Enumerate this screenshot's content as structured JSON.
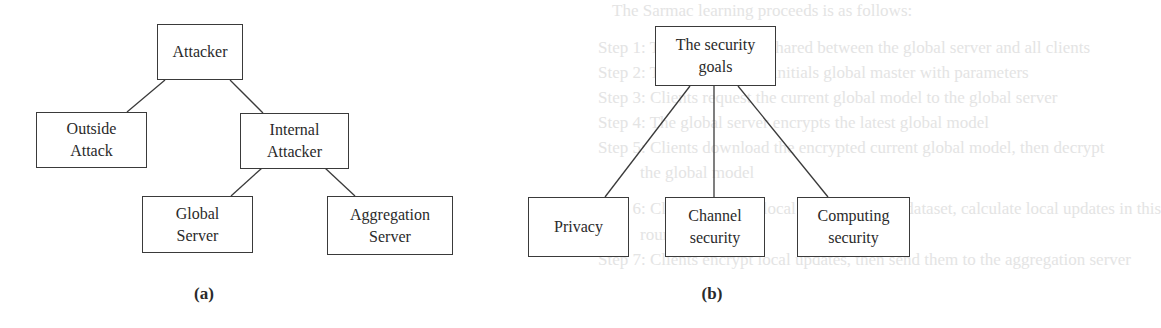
{
  "background_text": [
    {
      "text": "The Sarmac learning proceeds is as follows:",
      "x": 612,
      "y": 10
    },
    {
      "text": "Step 1: The secret key is shared between the global server and all clients",
      "x": 598,
      "y": 47
    },
    {
      "text": "Step 2: The global server initials global master with parameters",
      "x": 598,
      "y": 72
    },
    {
      "text": "Step 3: Clients request the current global model to the global server",
      "x": 598,
      "y": 97
    },
    {
      "text": "Step 4: The global server encrypts the latest global model",
      "x": 598,
      "y": 122
    },
    {
      "text": "Step 5: Clients download the encrypted current global model, then decrypt",
      "x": 598,
      "y": 147
    },
    {
      "text": "the global model",
      "x": 640,
      "y": 172
    },
    {
      "text": "Step 6: Clients train the local model on local dataset, calculate local updates in this",
      "x": 598,
      "y": 208
    },
    {
      "text": "round",
      "x": 640,
      "y": 234
    },
    {
      "text": "Step 7: Clients encrypt local updates, then send them to the aggregation server",
      "x": 598,
      "y": 259
    }
  ],
  "diagram_a": {
    "caption": "(a)",
    "nodes": {
      "attacker": {
        "lines": [
          "Attacker"
        ]
      },
      "outside_attack": {
        "lines": [
          "Outside",
          "Attack"
        ]
      },
      "internal_attacker": {
        "lines": [
          "Internal",
          "Attacker"
        ]
      },
      "global_server": {
        "lines": [
          "Global",
          "Server"
        ]
      },
      "aggregation_server": {
        "lines": [
          "Aggregation",
          "Server"
        ]
      }
    },
    "edges": [
      [
        "Attacker",
        "Outside Attack"
      ],
      [
        "Attacker",
        "Internal Attacker"
      ],
      [
        "Internal Attacker",
        "Global Server"
      ],
      [
        "Internal Attacker",
        "Aggregation Server"
      ]
    ]
  },
  "diagram_b": {
    "caption": "(b)",
    "nodes": {
      "security_goals": {
        "lines": [
          "The security",
          "goals"
        ]
      },
      "privacy": {
        "lines": [
          "Privacy"
        ]
      },
      "channel_security": {
        "lines": [
          "Channel",
          "security"
        ]
      },
      "computing_security": {
        "lines": [
          "Computing",
          "security"
        ]
      }
    },
    "edges": [
      [
        "The security goals",
        "Privacy"
      ],
      [
        "The security goals",
        "Channel security"
      ],
      [
        "The security goals",
        "Computing security"
      ]
    ]
  },
  "colors": {
    "stroke": "#3a3a3a",
    "text": "#2a2a2a",
    "background": "#ffffff",
    "bleed_text": "#e4e4e4"
  }
}
